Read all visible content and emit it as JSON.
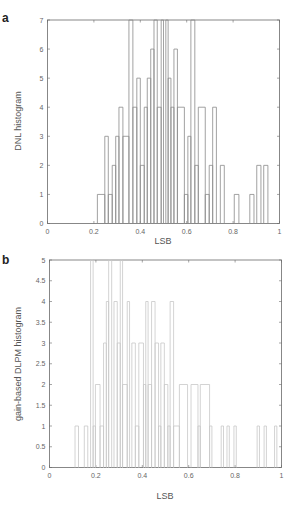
{
  "chart_data": [
    {
      "panel": "a",
      "type": "bar",
      "style": "step-histogram",
      "title": "",
      "xlabel": "LSB",
      "ylabel": "DNL histogram",
      "xlim": [
        0,
        1
      ],
      "ylim": [
        0,
        7
      ],
      "xticks": [
        "0",
        "0.2",
        "0.4",
        "0.6",
        "0.8",
        "1"
      ],
      "yticks": [
        "0",
        "1",
        "2",
        "3",
        "4",
        "5",
        "6",
        "7"
      ],
      "grid": false,
      "line_color": "#8a8a8a",
      "bins": [
        {
          "x0": 0.215,
          "x1": 0.247,
          "h": 1
        },
        {
          "x0": 0.247,
          "x1": 0.262,
          "h": 3
        },
        {
          "x0": 0.262,
          "x1": 0.279,
          "h": 1
        },
        {
          "x0": 0.279,
          "x1": 0.294,
          "h": 2
        },
        {
          "x0": 0.294,
          "x1": 0.308,
          "h": 3
        },
        {
          "x0": 0.308,
          "x1": 0.325,
          "h": 4
        },
        {
          "x0": 0.325,
          "x1": 0.351,
          "h": 3
        },
        {
          "x0": 0.351,
          "x1": 0.368,
          "h": 7
        },
        {
          "x0": 0.368,
          "x1": 0.385,
          "h": 4
        },
        {
          "x0": 0.385,
          "x1": 0.4,
          "h": 5
        },
        {
          "x0": 0.4,
          "x1": 0.417,
          "h": 2
        },
        {
          "x0": 0.417,
          "x1": 0.43,
          "h": 4
        },
        {
          "x0": 0.43,
          "x1": 0.445,
          "h": 5
        },
        {
          "x0": 0.445,
          "x1": 0.459,
          "h": 6
        },
        {
          "x0": 0.459,
          "x1": 0.473,
          "h": 7
        },
        {
          "x0": 0.473,
          "x1": 0.49,
          "h": 4
        },
        {
          "x0": 0.49,
          "x1": 0.5,
          "h": 7
        },
        {
          "x0": 0.5,
          "x1": 0.51,
          "h": 0
        },
        {
          "x0": 0.51,
          "x1": 0.52,
          "h": 7
        },
        {
          "x0": 0.52,
          "x1": 0.532,
          "h": 5
        },
        {
          "x0": 0.532,
          "x1": 0.545,
          "h": 4
        },
        {
          "x0": 0.545,
          "x1": 0.56,
          "h": 6
        },
        {
          "x0": 0.56,
          "x1": 0.59,
          "h": 4
        },
        {
          "x0": 0.59,
          "x1": 0.605,
          "h": 1
        },
        {
          "x0": 0.605,
          "x1": 0.618,
          "h": 3
        },
        {
          "x0": 0.618,
          "x1": 0.635,
          "h": 7
        },
        {
          "x0": 0.635,
          "x1": 0.65,
          "h": 2
        },
        {
          "x0": 0.65,
          "x1": 0.68,
          "h": 4
        },
        {
          "x0": 0.68,
          "x1": 0.697,
          "h": 1
        },
        {
          "x0": 0.697,
          "x1": 0.712,
          "h": 2
        },
        {
          "x0": 0.712,
          "x1": 0.728,
          "h": 4
        },
        {
          "x0": 0.728,
          "x1": 0.745,
          "h": 0
        },
        {
          "x0": 0.745,
          "x1": 0.762,
          "h": 2
        },
        {
          "x0": 0.762,
          "x1": 0.805,
          "h": 0
        },
        {
          "x0": 0.805,
          "x1": 0.825,
          "h": 1
        },
        {
          "x0": 0.825,
          "x1": 0.872,
          "h": 0
        },
        {
          "x0": 0.872,
          "x1": 0.89,
          "h": 1
        },
        {
          "x0": 0.89,
          "x1": 0.902,
          "h": 0
        },
        {
          "x0": 0.902,
          "x1": 0.92,
          "h": 2
        },
        {
          "x0": 0.92,
          "x1": 0.932,
          "h": 0
        },
        {
          "x0": 0.932,
          "x1": 0.95,
          "h": 2
        }
      ]
    },
    {
      "panel": "b",
      "type": "bar",
      "style": "step-histogram",
      "title": "",
      "xlabel": "LSB",
      "ylabel": "gain-based DLPM histogram",
      "xlim": [
        0,
        1
      ],
      "ylim": [
        0,
        5
      ],
      "xticks": [
        "0",
        "0.2",
        "0.4",
        "0.6",
        "0.8",
        "1"
      ],
      "yticks": [
        "0",
        "0.5",
        "1",
        "1.5",
        "2",
        "2.5",
        "3",
        "3.5",
        "4",
        "4.5",
        "5"
      ],
      "grid": false,
      "line_color": "#c8c8c8",
      "bins": [
        {
          "x0": 0.11,
          "x1": 0.125,
          "h": 1
        },
        {
          "x0": 0.125,
          "x1": 0.15,
          "h": 0
        },
        {
          "x0": 0.15,
          "x1": 0.165,
          "h": 1
        },
        {
          "x0": 0.165,
          "x1": 0.177,
          "h": 0
        },
        {
          "x0": 0.177,
          "x1": 0.188,
          "h": 5
        },
        {
          "x0": 0.188,
          "x1": 0.198,
          "h": 1
        },
        {
          "x0": 0.198,
          "x1": 0.218,
          "h": 2
        },
        {
          "x0": 0.218,
          "x1": 0.233,
          "h": 1
        },
        {
          "x0": 0.233,
          "x1": 0.245,
          "h": 3
        },
        {
          "x0": 0.245,
          "x1": 0.255,
          "h": 4
        },
        {
          "x0": 0.255,
          "x1": 0.268,
          "h": 5
        },
        {
          "x0": 0.268,
          "x1": 0.278,
          "h": 0
        },
        {
          "x0": 0.278,
          "x1": 0.292,
          "h": 4
        },
        {
          "x0": 0.292,
          "x1": 0.305,
          "h": 3
        },
        {
          "x0": 0.305,
          "x1": 0.315,
          "h": 5
        },
        {
          "x0": 0.315,
          "x1": 0.335,
          "h": 2
        },
        {
          "x0": 0.335,
          "x1": 0.345,
          "h": 4
        },
        {
          "x0": 0.345,
          "x1": 0.355,
          "h": 0
        },
        {
          "x0": 0.355,
          "x1": 0.37,
          "h": 3
        },
        {
          "x0": 0.37,
          "x1": 0.385,
          "h": 1
        },
        {
          "x0": 0.385,
          "x1": 0.405,
          "h": 3
        },
        {
          "x0": 0.405,
          "x1": 0.415,
          "h": 2
        },
        {
          "x0": 0.415,
          "x1": 0.425,
          "h": 4
        },
        {
          "x0": 0.425,
          "x1": 0.44,
          "h": 2
        },
        {
          "x0": 0.44,
          "x1": 0.455,
          "h": 4
        },
        {
          "x0": 0.455,
          "x1": 0.47,
          "h": 3
        },
        {
          "x0": 0.47,
          "x1": 0.48,
          "h": 1
        },
        {
          "x0": 0.48,
          "x1": 0.495,
          "h": 3
        },
        {
          "x0": 0.495,
          "x1": 0.51,
          "h": 2
        },
        {
          "x0": 0.51,
          "x1": 0.52,
          "h": 1
        },
        {
          "x0": 0.52,
          "x1": 0.535,
          "h": 4
        },
        {
          "x0": 0.535,
          "x1": 0.56,
          "h": 1
        },
        {
          "x0": 0.56,
          "x1": 0.595,
          "h": 2
        },
        {
          "x0": 0.595,
          "x1": 0.61,
          "h": 0
        },
        {
          "x0": 0.61,
          "x1": 0.64,
          "h": 2
        },
        {
          "x0": 0.64,
          "x1": 0.65,
          "h": 1
        },
        {
          "x0": 0.65,
          "x1": 0.69,
          "h": 2
        },
        {
          "x0": 0.69,
          "x1": 0.7,
          "h": 1
        },
        {
          "x0": 0.7,
          "x1": 0.74,
          "h": 0
        },
        {
          "x0": 0.74,
          "x1": 0.75,
          "h": 1
        },
        {
          "x0": 0.75,
          "x1": 0.765,
          "h": 0
        },
        {
          "x0": 0.765,
          "x1": 0.775,
          "h": 1
        },
        {
          "x0": 0.775,
          "x1": 0.795,
          "h": 0
        },
        {
          "x0": 0.795,
          "x1": 0.805,
          "h": 1
        },
        {
          "x0": 0.805,
          "x1": 0.895,
          "h": 0
        },
        {
          "x0": 0.895,
          "x1": 0.905,
          "h": 1
        },
        {
          "x0": 0.905,
          "x1": 0.925,
          "h": 0
        },
        {
          "x0": 0.925,
          "x1": 0.935,
          "h": 1
        },
        {
          "x0": 0.935,
          "x1": 0.97,
          "h": 0
        },
        {
          "x0": 0.97,
          "x1": 0.98,
          "h": 1
        }
      ]
    }
  ],
  "panels": {
    "a": {
      "letter": "a",
      "ylabel": "DNL histogram",
      "xlabel": "LSB"
    },
    "b": {
      "letter": "b",
      "ylabel": "gain-based DLPM histogram",
      "xlabel": "LSB"
    }
  }
}
